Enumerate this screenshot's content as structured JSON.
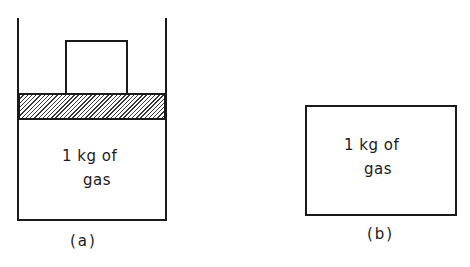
{
  "figure_a": {
    "gas_line1": "1 kg of",
    "gas_line2": "gas",
    "caption": "(a)",
    "parts": [
      "cylinder",
      "piston",
      "weight",
      "gas"
    ]
  },
  "figure_b": {
    "gas_line1": "1 kg of",
    "gas_line2": "gas",
    "caption": "(b)",
    "parts": [
      "rigid-container",
      "gas"
    ]
  },
  "colors": {
    "line": "#1a1a1a",
    "background": "#ffffff"
  }
}
